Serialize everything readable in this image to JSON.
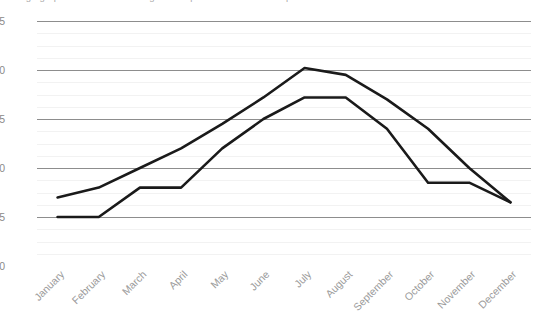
{
  "chart_data": {
    "type": "line",
    "title": "Average graph of the annual change in temperature values in °C per month",
    "xlabel": "",
    "ylabel": "",
    "categories": [
      "January",
      "February",
      "March",
      "April",
      "May",
      "June",
      "July",
      "August",
      "September",
      "October",
      "November",
      "December"
    ],
    "yticks": [
      0,
      5,
      10,
      15,
      20,
      25
    ],
    "ylim": [
      0,
      25
    ],
    "grid": true,
    "legend": "none",
    "series": [
      {
        "name": "Series 1",
        "color": "#1a1a1a",
        "values": [
          7,
          8,
          10,
          12,
          14.5,
          17.2,
          20.2,
          19.5,
          17,
          14,
          10,
          6.5
        ]
      },
      {
        "name": "Series 2",
        "color": "#1a1a1a",
        "values": [
          5,
          5,
          8,
          8,
          12,
          15,
          17.2,
          17.2,
          14,
          8.5,
          8.5,
          6.5
        ]
      }
    ]
  }
}
